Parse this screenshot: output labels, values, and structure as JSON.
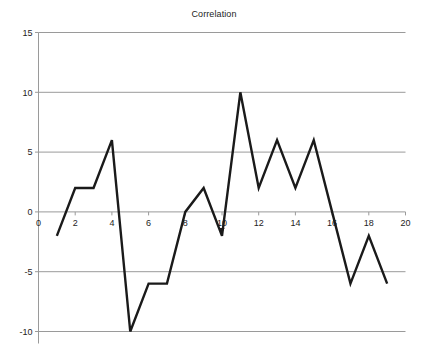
{
  "chart_data": {
    "type": "line",
    "title": "Correlation",
    "xlabel": "",
    "ylabel": "",
    "x": [
      1,
      2,
      3,
      4,
      5,
      6,
      7,
      8,
      9,
      10,
      11,
      12,
      13,
      14,
      15,
      16,
      17,
      18,
      19
    ],
    "values": [
      -2,
      2,
      2,
      6,
      -10,
      -6,
      -6,
      0,
      2,
      -2,
      10,
      2,
      6,
      2,
      6,
      0,
      -6,
      -2,
      -6
    ],
    "series": [
      {
        "name": "Correlation",
        "values": [
          -2,
          2,
          2,
          6,
          -10,
          -6,
          -6,
          0,
          2,
          -2,
          10,
          2,
          6,
          2,
          6,
          0,
          -6,
          -2,
          -6
        ]
      }
    ],
    "xlim": [
      0,
      20
    ],
    "ylim": [
      -10,
      15
    ],
    "x_ticks": [
      0,
      2,
      4,
      6,
      8,
      10,
      12,
      14,
      16,
      18,
      20
    ],
    "x_tick_labels": [
      "0",
      "2",
      "4",
      "6",
      "8",
      "10",
      "12",
      "14",
      "16",
      "18",
      "20"
    ],
    "y_ticks": [
      -10,
      -5,
      0,
      5,
      10,
      15
    ],
    "y_tick_labels": [
      "-10",
      "-5",
      "0",
      "5",
      "10",
      "15"
    ],
    "grid": "horizontal",
    "legend": "none",
    "line_color": "#1a1a1a",
    "grid_color": "#9a9a9a",
    "axis_color": "#9a9a9a",
    "background_color": "#ffffff",
    "line_width": 2.4
  }
}
